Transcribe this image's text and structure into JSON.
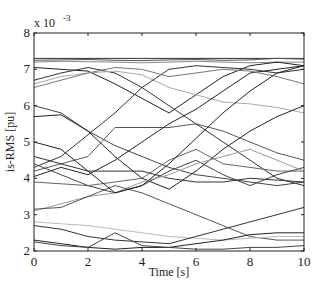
{
  "chart_data": {
    "type": "line",
    "title": "",
    "xlabel": "Time [s]",
    "ylabel": "is-RMS [pu]",
    "y_multiplier_label": "x 10",
    "y_multiplier_exponent": "-3",
    "xlim": [
      0,
      10
    ],
    "ylim": [
      2,
      8
    ],
    "xticks": [
      "0",
      "2",
      "4",
      "6",
      "8",
      "10"
    ],
    "yticks": [
      "2",
      "3",
      "4",
      "5",
      "6",
      "7",
      "8"
    ],
    "grid": false,
    "legend": "none",
    "x": [
      0,
      1,
      2,
      3,
      4,
      5,
      6,
      7,
      8,
      9,
      10
    ],
    "series": [
      {
        "name": "s1",
        "color": "#333333",
        "values": [
          7.3,
          7.3,
          7.3,
          7.3,
          7.3,
          7.3,
          7.3,
          7.3,
          7.3,
          7.3,
          7.3
        ]
      },
      {
        "name": "s2",
        "color": "#555555",
        "values": [
          7.25,
          7.26,
          7.27,
          7.25,
          7.24,
          7.26,
          7.27,
          7.25,
          7.26,
          7.3,
          7.28
        ]
      },
      {
        "name": "s3",
        "color": "#888888",
        "values": [
          7.2,
          7.22,
          7.21,
          7.2,
          7.18,
          7.2,
          7.22,
          7.2,
          7.18,
          7.2,
          7.2
        ]
      },
      {
        "name": "s4",
        "color": "#222222",
        "values": [
          7.05,
          7.0,
          6.95,
          6.6,
          6.2,
          5.8,
          6.3,
          6.8,
          7.1,
          7.2,
          7.1
        ]
      },
      {
        "name": "s5",
        "color": "#333333",
        "values": [
          6.7,
          6.9,
          7.05,
          6.9,
          6.5,
          6.0,
          5.5,
          5.0,
          4.5,
          4.0,
          3.8
        ]
      },
      {
        "name": "s6",
        "color": "#aaaaaa",
        "values": [
          6.6,
          6.8,
          6.9,
          6.95,
          6.85,
          6.5,
          6.3,
          6.1,
          6.05,
          5.95,
          5.8
        ]
      },
      {
        "name": "s7",
        "color": "#444444",
        "values": [
          6.0,
          5.8,
          5.3,
          4.9,
          4.6,
          4.3,
          4.1,
          4.0,
          3.9,
          3.8,
          3.9
        ]
      },
      {
        "name": "s8",
        "color": "#222222",
        "values": [
          5.7,
          5.75,
          5.3,
          4.6,
          4.0,
          3.7,
          4.2,
          4.8,
          5.3,
          5.7,
          6.0
        ]
      },
      {
        "name": "s9",
        "color": "#333333",
        "values": [
          4.3,
          4.6,
          5.2,
          5.8,
          6.5,
          7.0,
          7.1,
          7.05,
          7.0,
          6.9,
          7.0
        ]
      },
      {
        "name": "s10",
        "color": "#555555",
        "values": [
          4.2,
          4.4,
          4.6,
          5.4,
          5.4,
          5.4,
          5.5,
          5.3,
          5.0,
          4.7,
          4.5
        ]
      },
      {
        "name": "s11",
        "color": "#222222",
        "values": [
          4.05,
          4.3,
          4.1,
          4.5,
          5.0,
          5.5,
          5.9,
          6.4,
          6.9,
          7.0,
          7.1
        ]
      },
      {
        "name": "s12",
        "color": "#666666",
        "values": [
          3.9,
          3.85,
          3.8,
          3.9,
          4.0,
          4.5,
          4.8,
          4.4,
          4.3,
          4.2,
          4.2
        ]
      },
      {
        "name": "s13",
        "color": "#444444",
        "values": [
          4.4,
          4.1,
          3.8,
          3.6,
          3.8,
          4.2,
          4.5,
          4.1,
          3.8,
          4.1,
          4.3
        ]
      },
      {
        "name": "s14",
        "color": "#333333",
        "values": [
          4.6,
          4.4,
          4.2,
          4.2,
          4.2,
          4.0,
          3.9,
          3.9,
          4.0,
          3.95,
          3.9
        ]
      },
      {
        "name": "s15",
        "color": "#999999",
        "values": [
          3.1,
          3.3,
          3.5,
          3.6,
          3.9,
          4.1,
          4.4,
          4.6,
          4.8,
          4.5,
          4.2
        ]
      },
      {
        "name": "s16",
        "color": "#555555",
        "values": [
          3.15,
          3.2,
          3.5,
          3.8,
          3.6,
          3.3,
          3.0,
          2.7,
          2.4,
          2.3,
          2.3
        ]
      },
      {
        "name": "s17",
        "color": "#bbbbbb",
        "values": [
          2.8,
          2.75,
          2.7,
          2.6,
          2.5,
          2.4,
          2.35,
          2.3,
          2.35,
          2.4,
          2.4
        ]
      },
      {
        "name": "s18",
        "color": "#333333",
        "values": [
          2.7,
          2.6,
          2.4,
          2.3,
          2.25,
          2.2,
          2.4,
          2.6,
          2.8,
          3.0,
          3.2
        ]
      },
      {
        "name": "s19",
        "color": "#222222",
        "values": [
          2.3,
          2.2,
          2.1,
          2.05,
          2.1,
          2.1,
          2.2,
          2.3,
          2.45,
          2.5,
          2.5
        ]
      },
      {
        "name": "s20",
        "color": "#444444",
        "values": [
          2.25,
          2.15,
          2.1,
          2.5,
          2.15,
          2.1,
          2.05,
          2.05,
          2.1,
          2.1,
          2.15
        ]
      },
      {
        "name": "s21",
        "color": "#777777",
        "values": [
          6.5,
          6.7,
          6.9,
          7.05,
          7.0,
          6.8,
          6.9,
          7.0,
          6.95,
          6.8,
          6.6
        ]
      },
      {
        "name": "s22",
        "color": "#222222",
        "values": [
          5.0,
          4.8,
          4.2,
          3.6,
          3.8,
          4.4,
          5.1,
          5.8,
          6.4,
          6.9,
          7.1
        ]
      }
    ]
  }
}
